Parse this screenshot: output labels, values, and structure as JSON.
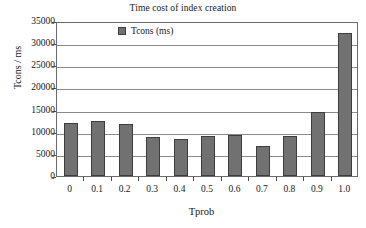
{
  "chart_data": {
    "type": "bar",
    "title": "Time cost of index creation",
    "xlabel": "Tprob",
    "ylabel": "Tcons / ms",
    "categories": [
      "0",
      "0.1",
      "0.2",
      "0.3",
      "0.4",
      "0.5",
      "0.6",
      "0.7",
      "0.8",
      "0.9",
      "1.0"
    ],
    "series": [
      {
        "name": "Tcons (ms)",
        "color": "#717171",
        "values": [
          12000,
          12400,
          11700,
          8800,
          8400,
          9000,
          9300,
          6800,
          9000,
          14500,
          32400
        ]
      }
    ],
    "ylim": [
      0,
      35000
    ],
    "yticks": [
      0,
      5000,
      10000,
      15000,
      20000,
      25000,
      30000,
      35000
    ],
    "ytick_labels": [
      "0",
      "5000",
      "10000",
      "15000",
      "20000",
      "25000",
      "30000",
      "35000"
    ],
    "grid": true,
    "grid_axis": "y",
    "legend": {
      "position": "upper-left-inside",
      "entries": [
        {
          "label": "Tcons (ms)",
          "swatch_color": "#717171",
          "swatch_name": "legend-swatch-tcons"
        }
      ]
    },
    "frame": true,
    "background_color": "#ffffff",
    "axis_color": "#6b6b6b"
  }
}
